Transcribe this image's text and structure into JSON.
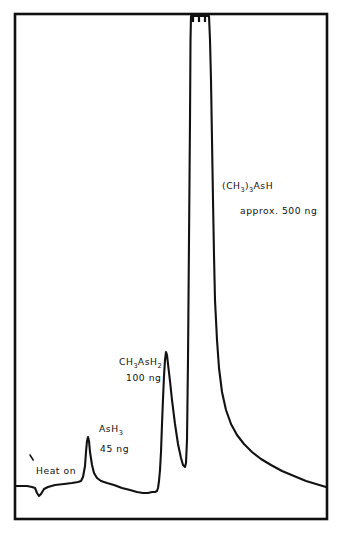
{
  "figure": {
    "type": "chromatogram",
    "background_color": "#ffffff",
    "trace_color": "#121212",
    "frame_color": "#101010"
  },
  "frame": {
    "x": 15,
    "y": 14,
    "width": 312,
    "height": 505
  },
  "annotations": [
    {
      "name": "heat-on-label",
      "text": "Heat on",
      "x": 36,
      "y": 474,
      "has_tick_marker": true,
      "tick_x": 30,
      "tick_y": 455
    },
    {
      "name": "ash3-label",
      "base": "AsH",
      "sub": "3",
      "amount": "45 ng",
      "x": 99,
      "y": 432,
      "amount_x": 100,
      "amount_y": 452
    },
    {
      "name": "ch3ash2-label",
      "parts": [
        {
          "t": "CH",
          "sub": false
        },
        {
          "t": "3",
          "sub": true
        },
        {
          "t": "AsH",
          "sub": false
        },
        {
          "t": "2",
          "sub": true
        }
      ],
      "amount": "100 ng",
      "x": 119,
      "y": 365,
      "amount_x": 126,
      "amount_y": 381
    },
    {
      "name": "ch3-3-ash-label",
      "parts": [
        {
          "t": "(CH",
          "sub": false
        },
        {
          "t": "3",
          "sub": true
        },
        {
          "t": ")",
          "sub": false
        },
        {
          "t": "3",
          "sub": true
        },
        {
          "t": "AsH",
          "sub": false
        }
      ],
      "amount": "approx. 500 ng",
      "x": 222,
      "y": 189,
      "amount_x": 240,
      "amount_y": 214
    }
  ],
  "chart_data": {
    "type": "line",
    "title": "",
    "xlabel": "",
    "ylabel": "",
    "grid": false,
    "legend": false,
    "axis_ticks": false,
    "xlim": [
      15,
      327
    ],
    "ylim": [
      14,
      519
    ],
    "note": "Signal increases upward; y pixel values are screen coordinates (smaller y = higher signal). Peak top of (CH3)3AsH is clipped off-scale at the top frame.",
    "peaks": [
      {
        "label": "Heat on",
        "kind": "negative-spike",
        "apex_x": 38,
        "apex_y": 496,
        "baseline_y": 486,
        "amount": null
      },
      {
        "label": "AsH3",
        "kind": "peak",
        "apex_x": 88,
        "apex_y": 437,
        "baseline_y": 486,
        "amount_ng": 45,
        "amount_text": "45 ng"
      },
      {
        "label": "CH3AsH2",
        "kind": "peak",
        "apex_x": 166,
        "apex_y": 352,
        "baseline_y": 490,
        "amount_ng": 100,
        "amount_text": "100 ng"
      },
      {
        "label": "(CH3)3AsH",
        "kind": "peak-offscale",
        "apex_x": 199,
        "apex_y": 14,
        "baseline_y": 487,
        "amount_ng": 500,
        "amount_text": "approx. 500 ng",
        "clipped": true,
        "plateau_from_x": 190,
        "plateau_to_x": 209
      }
    ],
    "clip_marks": {
      "count": 3,
      "y": 17,
      "xs": [
        193,
        199,
        205
      ],
      "height": 5
    },
    "trace_path": "M 16,486 L 27,486 L 32,487 L 35,488 L 37,493 L 39,496 L 41,494 L 44,489 L 48,487 L 55,485 L 64,484 L 72,483 L 78,482 L 81,481 L 83,477 L 85,466 L 86,452 L 87,441 L 88,437 L 89,441 L 90,452 L 92,465 L 94,473 L 97,478 L 101,481 L 107,483 L 114,485 L 122,488 L 130,490 L 137,492 L 143,493 L 148,493 L 152,492 L 155,492 L 157,491 L 158,488 L 159,481 L 160,470 L 161,452 L 162,424 L 163,399 L 164,376 L 165,360 L 166,352 L 167,355 L 168,364 L 170,381 L 172,400 L 175,424 L 178,444 L 181,458 L 183,465 L 185,467 L 186,463 L 187,440 L 188,360 L 189,240 L 190,120 L 190.5,40 L 191,16 L 209,16 L 210,40 L 211,80 L 212,140 L 213,200 L 214,255 L 215,300 L 217,340 L 219,368 L 222,392 L 226,410 L 231,424 L 237,435 L 244,444 L 252,452 L 261,459 L 271,465 L 282,471 L 294,476 L 306,481 L 316,484 L 326,487"
  }
}
